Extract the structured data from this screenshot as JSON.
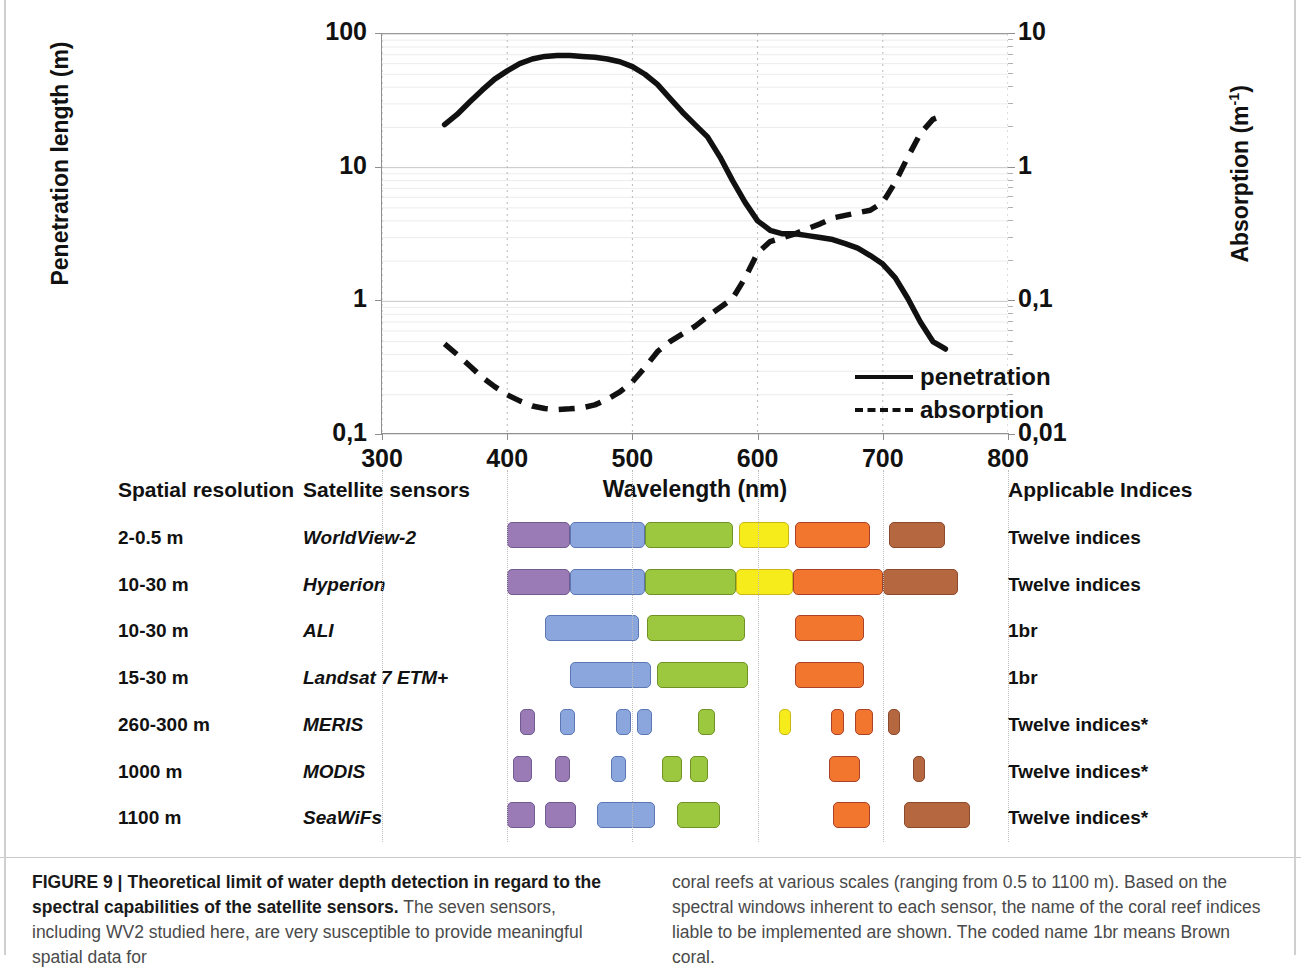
{
  "figure": {
    "label": "FIGURE 9 |",
    "title_bold": "Theoretical limit of water depth detection in regard to the spectral capabilities of the satellite sensors.",
    "caption_left": " The seven sensors, including WV2 studied here, are very susceptible to provide meaningful spatial data for",
    "caption_right": "coral reefs at various scales (ranging from 0.5 to 1100 m). Based on the spectral windows inherent to each sensor, the name of the coral reef indices liable to be implemented are shown. The coded name 1br means Brown coral."
  },
  "chart_data": {
    "type": "line",
    "title": "",
    "xlabel": "Wavelength (nm)",
    "ylabel_left": "Penetration length (m)",
    "ylabel_right": "Absorption (m⁻¹)",
    "xlim": [
      300,
      800
    ],
    "xticks": [
      300,
      400,
      500,
      600,
      700,
      800
    ],
    "xticklabels": [
      "300",
      "400",
      "500",
      "600",
      "700",
      "800"
    ],
    "yscale": "log",
    "ylim_left": [
      0.1,
      100
    ],
    "yticks_left": [
      0.1,
      1,
      10,
      100
    ],
    "yticklabels_left": [
      "0,1",
      "1",
      "10",
      "100"
    ],
    "ylim_right": [
      0.01,
      10
    ],
    "yticks_right": [
      0.01,
      0.1,
      1,
      10
    ],
    "yticklabels_right": [
      "0,01",
      "0,1",
      "1",
      "10"
    ],
    "grid": true,
    "legend_position": "lower-right-inside",
    "series": [
      {
        "name": "penetration",
        "axis": "left",
        "style": "solid",
        "x": [
          350,
          360,
          370,
          380,
          390,
          400,
          410,
          420,
          430,
          440,
          450,
          460,
          470,
          480,
          490,
          500,
          510,
          520,
          530,
          540,
          550,
          560,
          570,
          580,
          590,
          600,
          610,
          620,
          630,
          640,
          650,
          660,
          670,
          680,
          690,
          700,
          710,
          720,
          730,
          740,
          750
        ],
        "values": [
          21,
          25,
          31,
          38,
          46,
          53,
          60,
          65,
          68,
          69,
          69,
          68,
          67,
          65,
          62,
          57,
          50,
          42,
          33,
          26,
          21,
          17,
          12,
          8.0,
          5.5,
          4.0,
          3.4,
          3.2,
          3.2,
          3.1,
          3.0,
          2.9,
          2.7,
          2.5,
          2.2,
          1.9,
          1.5,
          1.05,
          0.7,
          0.5,
          0.44
        ]
      },
      {
        "name": "absorption",
        "axis": "right",
        "style": "dashed",
        "x": [
          350,
          360,
          370,
          380,
          390,
          400,
          410,
          420,
          430,
          440,
          450,
          460,
          470,
          480,
          490,
          500,
          510,
          520,
          530,
          540,
          550,
          560,
          570,
          580,
          590,
          600,
          610,
          620,
          630,
          640,
          650,
          660,
          670,
          680,
          690,
          700,
          710,
          720,
          730,
          740,
          750
        ],
        "values": [
          0.048,
          0.04,
          0.033,
          0.027,
          0.023,
          0.02,
          0.018,
          0.0165,
          0.0158,
          0.0155,
          0.0157,
          0.016,
          0.0168,
          0.0185,
          0.021,
          0.025,
          0.032,
          0.042,
          0.05,
          0.057,
          0.065,
          0.077,
          0.09,
          0.105,
          0.15,
          0.23,
          0.28,
          0.3,
          0.32,
          0.35,
          0.38,
          0.42,
          0.44,
          0.46,
          0.48,
          0.55,
          0.78,
          1.2,
          1.8,
          2.3,
          2.5
        ]
      }
    ],
    "legend": [
      {
        "label": "penetration",
        "style": "solid"
      },
      {
        "label": "absorption",
        "style": "dashed"
      }
    ]
  },
  "table": {
    "headers": {
      "resolution": "Spatial resolution",
      "sensors": "Satellite sensors",
      "indices": "Applicable Indices"
    },
    "colors": {
      "purple": "#9a7bb5",
      "blue": "#8ba6dd",
      "green": "#9cc83f",
      "yellow": "#f6ec1c",
      "orange": "#f2762e",
      "brown": "#b5683f",
      "purple_border": "#6f5b8e",
      "blue_border": "#5b78b5",
      "green_border": "#6f9126",
      "yellow_border": "#c9b713",
      "orange_border": "#a8432a",
      "brown_border": "#8a4a2d"
    },
    "rows": [
      {
        "resolution": "2-0.5 m",
        "sensor": "WorldView-2",
        "indices": "Twelve indices",
        "bands": [
          {
            "color": "purple",
            "start": 400,
            "end": 450
          },
          {
            "color": "blue",
            "start": 450,
            "end": 510
          },
          {
            "color": "green",
            "start": 510,
            "end": 580
          },
          {
            "color": "yellow",
            "start": 585,
            "end": 625
          },
          {
            "color": "orange",
            "start": 630,
            "end": 690
          },
          {
            "color": "brown",
            "start": 705,
            "end": 750
          }
        ]
      },
      {
        "resolution": "10-30 m",
        "sensor": "Hyperion",
        "indices": "Twelve indices",
        "bands": [
          {
            "color": "purple",
            "start": 400,
            "end": 450
          },
          {
            "color": "blue",
            "start": 450,
            "end": 510
          },
          {
            "color": "green",
            "start": 510,
            "end": 583
          },
          {
            "color": "yellow",
            "start": 583,
            "end": 628
          },
          {
            "color": "orange",
            "start": 628,
            "end": 700
          },
          {
            "color": "brown",
            "start": 700,
            "end": 760
          }
        ]
      },
      {
        "resolution": "10-30 m",
        "sensor": "ALI",
        "indices": "1br",
        "bands": [
          {
            "color": "blue",
            "start": 430,
            "end": 505
          },
          {
            "color": "green",
            "start": 512,
            "end": 590
          },
          {
            "color": "orange",
            "start": 630,
            "end": 685
          }
        ]
      },
      {
        "resolution": "15-30 m",
        "sensor": "Landsat 7 ETM+",
        "indices": "1br",
        "bands": [
          {
            "color": "blue",
            "start": 450,
            "end": 515
          },
          {
            "color": "green",
            "start": 520,
            "end": 592
          },
          {
            "color": "orange",
            "start": 630,
            "end": 685
          }
        ]
      },
      {
        "resolution": "260-300 m",
        "sensor": "MERIS",
        "indices": "Twelve indices*",
        "bands": [
          {
            "color": "purple",
            "start": 410,
            "end": 422
          },
          {
            "color": "blue",
            "start": 442,
            "end": 454
          },
          {
            "color": "blue",
            "start": 487,
            "end": 499
          },
          {
            "color": "blue",
            "start": 504,
            "end": 516
          },
          {
            "color": "green",
            "start": 552,
            "end": 566
          },
          {
            "color": "yellow",
            "start": 617,
            "end": 627
          },
          {
            "color": "orange",
            "start": 659,
            "end": 669
          },
          {
            "color": "orange",
            "start": 678,
            "end": 692
          },
          {
            "color": "brown",
            "start": 704,
            "end": 714
          }
        ]
      },
      {
        "resolution": "1000 m",
        "sensor": "MODIS",
        "indices": "Twelve indices*",
        "bands": [
          {
            "color": "purple",
            "start": 405,
            "end": 420
          },
          {
            "color": "purple",
            "start": 438,
            "end": 450
          },
          {
            "color": "blue",
            "start": 483,
            "end": 495
          },
          {
            "color": "green",
            "start": 524,
            "end": 540
          },
          {
            "color": "green",
            "start": 546,
            "end": 560
          },
          {
            "color": "orange",
            "start": 657,
            "end": 682
          },
          {
            "color": "brown",
            "start": 724,
            "end": 734
          }
        ]
      },
      {
        "resolution": "1100 m",
        "sensor": "SeaWiFs",
        "indices": "Twelve indices*",
        "bands": [
          {
            "color": "purple",
            "start": 400,
            "end": 422
          },
          {
            "color": "purple",
            "start": 430,
            "end": 455
          },
          {
            "color": "blue",
            "start": 472,
            "end": 518
          },
          {
            "color": "green",
            "start": 536,
            "end": 570
          },
          {
            "color": "orange",
            "start": 660,
            "end": 690
          },
          {
            "color": "brown",
            "start": 717,
            "end": 770
          }
        ]
      }
    ]
  }
}
